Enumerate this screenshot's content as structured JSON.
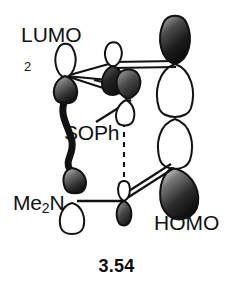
{
  "figure": {
    "caption": "3.54",
    "labels": {
      "lumo": "LUMO",
      "homo": "HOMO",
      "multiplier": "2",
      "sulfoxide": "SOPh",
      "amine_prefix": "Me",
      "amine_sub": "2",
      "amine_suffix": "N"
    },
    "colors": {
      "filled_lobe_dark": "#1a1a1a",
      "filled_lobe_mid": "#6e6e6e",
      "filled_lobe_light": "#c9c9c9",
      "empty_lobe_fill": "#ffffff",
      "outline": "#111111",
      "bond": "#111111",
      "dashed_interaction": "#111111",
      "background": "#ffffff",
      "text": "#111111"
    },
    "orbitals": [
      {
        "name": "lumo-left-top-lobe",
        "phase": "empty",
        "x": 63,
        "y": 58
      },
      {
        "name": "lumo-left-bottom-lobe",
        "phase": "filled",
        "x": 63,
        "y": 91
      },
      {
        "name": "lumo-center-top-lobe",
        "phase": "empty",
        "x": 113,
        "y": 52
      },
      {
        "name": "lumo-center-bottom-lobe",
        "phase": "filled",
        "x": 113,
        "y": 85
      },
      {
        "name": "lumo-center-right-top-lobe",
        "phase": "filled",
        "x": 128,
        "y": 83
      },
      {
        "name": "lumo-center-right-bottom-lobe",
        "phase": "empty",
        "x": 124,
        "y": 114
      },
      {
        "name": "homo-right-top-lobe",
        "phase": "filled",
        "x": 175,
        "y": 38
      },
      {
        "name": "homo-right-upper-mid-lobe",
        "phase": "empty",
        "x": 175,
        "y": 90
      },
      {
        "name": "homo-right-lower-mid-lobe",
        "phase": "empty",
        "x": 175,
        "y": 140
      },
      {
        "name": "homo-right-bottom-lobe",
        "phase": "filled",
        "x": 181,
        "y": 192
      },
      {
        "name": "alkyl-lower-left-lobe",
        "phase": "filled",
        "x": 72,
        "y": 172
      },
      {
        "name": "amine-lower-lobe",
        "phase": "empty",
        "x": 72,
        "y": 214
      },
      {
        "name": "center-bottom-top-lobe",
        "phase": "empty",
        "x": 124,
        "y": 190
      },
      {
        "name": "center-bottom-bottom-lobe",
        "phase": "filled",
        "x": 124,
        "y": 215
      }
    ],
    "bonds": [
      {
        "name": "lumo-left-to-center-upper",
        "style": "solid"
      },
      {
        "name": "lumo-left-to-center-mid",
        "style": "solid"
      },
      {
        "name": "lumo-left-to-center-lower",
        "style": "solid"
      },
      {
        "name": "lumo-center-to-homo-top-double",
        "style": "double"
      },
      {
        "name": "curved-backbone-left",
        "style": "thick-curve"
      },
      {
        "name": "me2n-to-center-bottom",
        "style": "solid"
      },
      {
        "name": "center-bottom-to-homo-double",
        "style": "double"
      },
      {
        "name": "soph-leader",
        "style": "solid"
      },
      {
        "name": "homo-vertical-dashed",
        "style": "dashed"
      },
      {
        "name": "center-vertical-dashed",
        "style": "dashed"
      }
    ]
  }
}
